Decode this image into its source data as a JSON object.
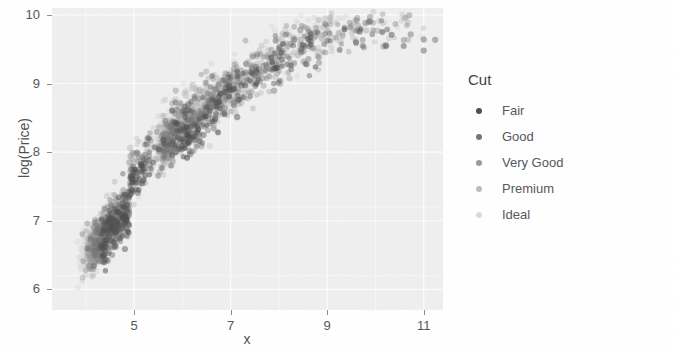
{
  "chart_data": {
    "type": "scatter",
    "title": "",
    "xlabel": "x",
    "ylabel": "log(Price)",
    "xlim": [
      3.3,
      11.4
    ],
    "ylim": [
      5.7,
      10.1
    ],
    "xticks": [
      5,
      7,
      9,
      11
    ],
    "yticks": [
      6,
      7,
      8,
      9,
      10
    ],
    "xtick_labels": [
      "5",
      "7",
      "9",
      "11"
    ],
    "ytick_labels": [
      "6",
      "7",
      "8",
      "9",
      "10"
    ],
    "grid": true,
    "grid_color": "#ffffff",
    "panel_background": "#efefef",
    "point_opacity": 0.45,
    "point_radius": 2.9,
    "legend": {
      "title": "Cut",
      "position": "right",
      "entries": [
        {
          "label": "Fair",
          "color": "#4f4f4f"
        },
        {
          "label": "Good",
          "color": "#757575"
        },
        {
          "label": "Very Good",
          "color": "#9a9a9a"
        },
        {
          "label": "Premium",
          "color": "#bcbcbc"
        },
        {
          "label": "Ideal",
          "color": "#dadada"
        }
      ]
    },
    "series": [
      {
        "name": "Fair",
        "color": "#4f4f4f",
        "n": 320
      },
      {
        "name": "Good",
        "color": "#757575",
        "n": 460
      },
      {
        "name": "Very Good",
        "color": "#9a9a9a",
        "n": 620
      },
      {
        "name": "Premium",
        "color": "#bcbcbc",
        "n": 640
      },
      {
        "name": "Ideal",
        "color": "#dadada",
        "n": 700
      }
    ]
  }
}
